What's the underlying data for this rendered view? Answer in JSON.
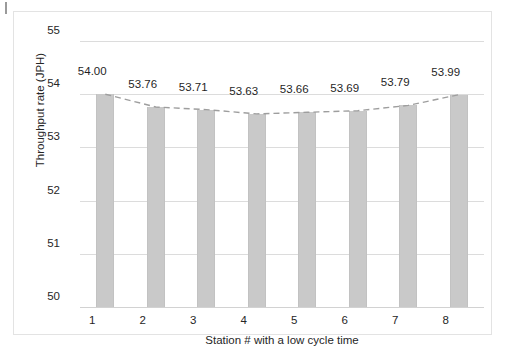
{
  "chart_data": {
    "type": "bar",
    "title": "",
    "xlabel": "Station # with a low cycle time",
    "ylabel": "Throughput rate (JPH)",
    "categories": [
      "1",
      "2",
      "3",
      "4",
      "5",
      "6",
      "7",
      "8"
    ],
    "values": [
      54.0,
      53.76,
      53.71,
      53.63,
      53.66,
      53.69,
      53.79,
      53.99
    ],
    "value_labels": [
      "54.00",
      "53.76",
      "53.71",
      "53.63",
      "53.66",
      "53.69",
      "53.79",
      "53.99"
    ],
    "ylim": [
      50,
      55
    ],
    "yticks": [
      55,
      54,
      53,
      52,
      51,
      50
    ],
    "ytick_labels": [
      "55",
      "54",
      "53",
      "52",
      "51",
      "50"
    ],
    "grid": true,
    "legend": "none",
    "series": [
      {
        "name": "Throughput rate",
        "type": "bar",
        "values": [
          54.0,
          53.76,
          53.71,
          53.63,
          53.66,
          53.69,
          53.79,
          53.99
        ],
        "color": "#c9c9c9"
      },
      {
        "name": "Trendline",
        "type": "line",
        "style": "dashed",
        "color": "#9e9e9e",
        "values": [
          54.0,
          53.76,
          53.71,
          53.63,
          53.66,
          53.69,
          53.79,
          53.99
        ]
      }
    ]
  },
  "colors": {
    "bar_fill": "#c9c9c9",
    "trendline": "#9e9e9e",
    "gridline": "#dcdcdc",
    "frame_border": "#e3e3e3",
    "text": "#262626",
    "background": "#ffffff"
  }
}
